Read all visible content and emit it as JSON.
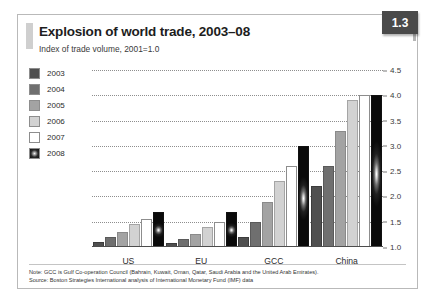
{
  "figure": {
    "badge": "1.3",
    "title": "Explosion of world trade, 2003–08",
    "subtitle": "Index of trade volume, 2001=1.0",
    "note": "Note: GCC is Gulf Co-operation Council (Bahrain, Kuwait, Oman, Qatar, Saudi Arabia and the United Arab Emirates).",
    "source": "Source: Boston Strategies International analysis of International Monetary Fund (IMF) data"
  },
  "legend": {
    "items": [
      {
        "label": "2003",
        "color": "#4f4f4f"
      },
      {
        "label": "2004",
        "color": "#6f6f6f"
      },
      {
        "label": "2005",
        "color": "#a3a3a3"
      },
      {
        "label": "2006",
        "color": "#d2d2d2"
      },
      {
        "label": "2007",
        "color": "#ffffff"
      },
      {
        "label": "2008",
        "color": "#1a1a1a"
      }
    ]
  },
  "chart_data": {
    "type": "bar",
    "title": "Explosion of world trade, 2003–08",
    "subtitle": "Index of trade volume, 2001=1.0",
    "xlabel": "",
    "ylabel": "Index of trade volume, 2001=1.0",
    "ylim": [
      1.0,
      4.5
    ],
    "yticks": [
      "1.0",
      "1.5",
      "2.0",
      "2.5",
      "3.0",
      "3.5",
      "4.0",
      "4.5"
    ],
    "ytick_values": [
      1.0,
      1.5,
      2.0,
      2.5,
      3.0,
      3.5,
      4.0,
      4.5
    ],
    "grid": true,
    "y_axis_position": "right",
    "legend_position": "left",
    "categories": [
      "US",
      "EU",
      "GCC",
      "China"
    ],
    "series": [
      {
        "name": "2003",
        "values": [
          1.1,
          1.08,
          1.2,
          2.2
        ]
      },
      {
        "name": "2004",
        "values": [
          1.2,
          1.15,
          1.5,
          2.6
        ]
      },
      {
        "name": "2005",
        "values": [
          1.3,
          1.25,
          1.9,
          3.3
        ]
      },
      {
        "name": "2006",
        "values": [
          1.45,
          1.4,
          2.3,
          3.9
        ]
      },
      {
        "name": "2007",
        "values": [
          1.55,
          1.5,
          2.6,
          4.0
        ]
      },
      {
        "name": "2008",
        "values": [
          1.7,
          1.7,
          3.0,
          4.0
        ]
      }
    ]
  }
}
